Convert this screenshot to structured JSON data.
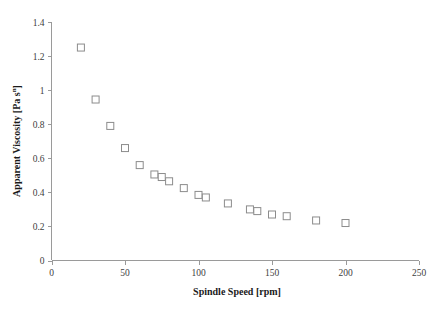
{
  "chart_data": {
    "type": "scatter",
    "title": "",
    "xlabel": "Spindle Speed [rpm]",
    "ylabel": "Apparent Viscosity [Pa s",
    "ylabel_superscript": "n",
    "ylabel_suffix": "]",
    "xlim": [
      0,
      250
    ],
    "ylim": [
      0,
      1.4
    ],
    "xticks": [
      0,
      50,
      100,
      150,
      200,
      250
    ],
    "yticks": [
      0,
      0.2,
      0.4,
      0.6,
      0.8,
      1,
      1.2,
      1.4
    ],
    "xtick_labels": [
      "0",
      "50",
      "100",
      "150",
      "200",
      "250"
    ],
    "ytick_labels": [
      "0",
      "0.2",
      "0.4",
      "0.6",
      "0.8",
      "1",
      "1.2",
      "1.4"
    ],
    "grid": false,
    "legend": false,
    "marker": "open-square",
    "marker_color": "#8c8c8c",
    "marker_fill": "#ffffff",
    "axis_color": "#9a9a9a",
    "series": [
      {
        "name": "Apparent Viscosity",
        "points": [
          {
            "x": 20,
            "y": 1.25
          },
          {
            "x": 30,
            "y": 0.945
          },
          {
            "x": 40,
            "y": 0.79
          },
          {
            "x": 50,
            "y": 0.66
          },
          {
            "x": 60,
            "y": 0.56
          },
          {
            "x": 70,
            "y": 0.505
          },
          {
            "x": 75,
            "y": 0.49
          },
          {
            "x": 80,
            "y": 0.465
          },
          {
            "x": 90,
            "y": 0.425
          },
          {
            "x": 100,
            "y": 0.385
          },
          {
            "x": 105,
            "y": 0.37
          },
          {
            "x": 120,
            "y": 0.335
          },
          {
            "x": 135,
            "y": 0.3
          },
          {
            "x": 140,
            "y": 0.29
          },
          {
            "x": 150,
            "y": 0.27
          },
          {
            "x": 160,
            "y": 0.26
          },
          {
            "x": 180,
            "y": 0.235
          },
          {
            "x": 200,
            "y": 0.22
          }
        ]
      }
    ]
  }
}
